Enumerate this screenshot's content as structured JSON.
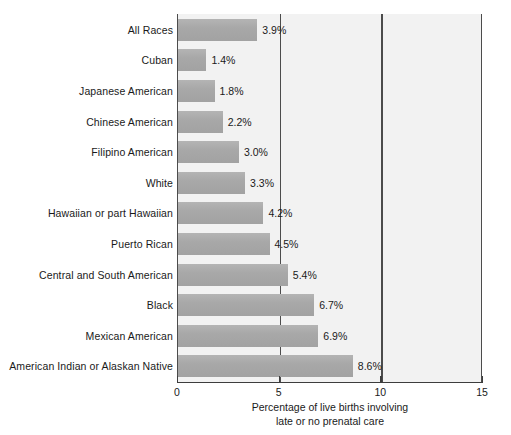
{
  "chart_data": {
    "type": "bar",
    "orientation": "horizontal",
    "title": "",
    "xlabel_line1": "Percentage of live births involving",
    "xlabel_line2": "late or no prenatal care",
    "ylabel": "",
    "xlim": [
      0,
      15
    ],
    "xticks": [
      0,
      5,
      10,
      15
    ],
    "xtick_labels": [
      "0",
      "5",
      "10",
      "15"
    ],
    "grid": true,
    "legend": "none",
    "categories": [
      "All Races",
      "Cuban",
      "Japanese American",
      "Chinese American",
      "Filipino American",
      "White",
      "Hawaiian or part Hawaiian",
      "Puerto Rican",
      "Central and South American",
      "Black",
      "Mexican American",
      "American Indian or Alaskan Native"
    ],
    "values": [
      3.9,
      1.4,
      1.8,
      2.2,
      3.0,
      3.3,
      4.2,
      4.5,
      5.4,
      6.7,
      6.9,
      8.6
    ],
    "value_labels": [
      "3.9%",
      "1.4%",
      "1.8%",
      "2.2%",
      "3.0%",
      "3.3%",
      "4.2%",
      "4.5%",
      "5.4%",
      "6.7%",
      "6.9%",
      "8.6%"
    ],
    "colors": {
      "bar_fill": "#a8a8a8",
      "plot_background": "#f2f2f2",
      "page_background": "#ffffff",
      "axis": "#3d3d3d",
      "text": "#1a1a1a"
    }
  }
}
